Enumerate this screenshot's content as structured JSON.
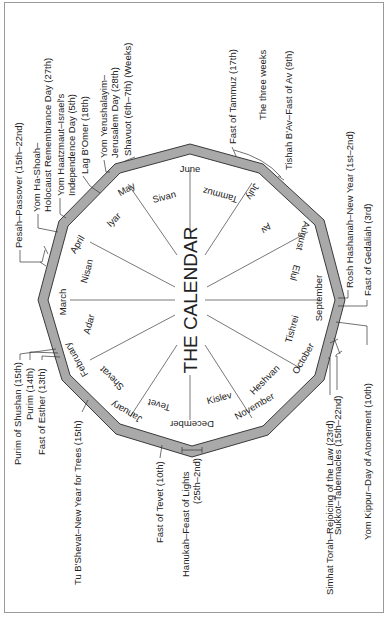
{
  "title": "THE CALENDAR",
  "colors": {
    "ring": "#a9a9a9",
    "ring_edge": "#3a3a3a",
    "spoke": "#555555",
    "text": "#222222",
    "frame": "#9a9a9a"
  },
  "months": [
    {
      "gregorian": "June",
      "hebrew": "Sivan"
    },
    {
      "gregorian": "July",
      "hebrew": "Tammuz"
    },
    {
      "gregorian": "August",
      "hebrew": "Av"
    },
    {
      "gregorian": "September",
      "hebrew": "Elul"
    },
    {
      "gregorian": "October",
      "hebrew": "Tishrei"
    },
    {
      "gregorian": "November",
      "hebrew": "Heshvan"
    },
    {
      "gregorian": "December",
      "hebrew": "Kislev"
    },
    {
      "gregorian": "January",
      "hebrew": "Tevet"
    },
    {
      "gregorian": "February",
      "hebrew": "Shevat"
    },
    {
      "gregorian": "March",
      "hebrew": "Adar"
    },
    {
      "gregorian": "April",
      "hebrew": "Nisan"
    },
    {
      "gregorian": "May",
      "hebrew": "Iyar"
    }
  ],
  "holidays": {
    "pesah": "Pesah–Passover (15th–22nd)",
    "yom_hashoah_1": "Yom Ha-Shoah–",
    "yom_hashoah_2": "Holocaust Remembrance Day (27th)",
    "yom_haatzmaut_1": "Yom Haatzmaut–Israel's",
    "yom_haatzmaut_2": "Independence Day (5th)",
    "lag_bomer": "Lag B'Omer (18th)",
    "yom_yerushalayim_1": "Yom Yerushalayim–",
    "yom_yerushalayim_2": "Jerusalem Day (28th)",
    "shavuot": "Shavuot (6th–7th) (Weeks)",
    "fast_tammuz": "Fast of Tammuz (17th)",
    "three_weeks": "The three weeks",
    "tishah_bav": "Tishah B'Av–Fast of Av (9th)",
    "rosh_hashanah": "Rosh Hashanah–New Year (1st–2nd)",
    "fast_gedaliah": "Fast of Gedaliah (3rd)",
    "yom_kippur": "Yom Kippur–Day of Atonement (10th)",
    "sukkot": "Sukkot–Tabernacles (15th–22nd)",
    "simhat_torah": "Simhat Torah–Rejoicing of the Law (23rd)",
    "hanukah_1": "Hanukah–Feast of Lights",
    "hanukah_2": "(25th–2nd)",
    "fast_tevet": "Fast of Tevet (10th)",
    "tu_bshevat": "Tu B'Shevat–New Year for Trees (15th)",
    "fast_esther": "Fast of Esther (13th)",
    "purim": "Purim (14th)",
    "purim_shushan": "Purim of Shushan (15th)"
  }
}
